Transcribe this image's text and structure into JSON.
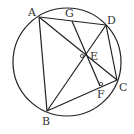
{
  "diagram": {
    "type": "geometry",
    "stroke_color": "#222222",
    "circle": {
      "cx": 67,
      "cy": 62,
      "r": 54
    },
    "points": {
      "A": {
        "label": "A",
        "x": 39,
        "y": 17,
        "lx": 28,
        "ly": 16
      },
      "B": {
        "label": "B",
        "x": 47,
        "y": 111,
        "lx": 42,
        "ly": 125
      },
      "C": {
        "label": "C",
        "x": 117,
        "y": 80,
        "lx": 119,
        "ly": 91
      },
      "D": {
        "label": "D",
        "x": 106,
        "y": 25,
        "lx": 107,
        "ly": 24
      },
      "E": {
        "label": "E",
        "x": 86,
        "y": 55,
        "lx": 90,
        "ly": 60
      },
      "F": {
        "label": "F",
        "x": 100,
        "y": 86,
        "lx": 97,
        "ly": 98
      },
      "G": {
        "label": "G",
        "x": 72,
        "y": 21,
        "lx": 65,
        "ly": 17
      }
    },
    "segments": [
      [
        "A",
        "B"
      ],
      [
        "B",
        "C"
      ],
      [
        "C",
        "D"
      ],
      [
        "D",
        "A"
      ],
      [
        "A",
        "C"
      ],
      [
        "B",
        "D"
      ],
      [
        "G",
        "F"
      ]
    ],
    "right_angle_marks": [
      "E",
      "F"
    ]
  }
}
